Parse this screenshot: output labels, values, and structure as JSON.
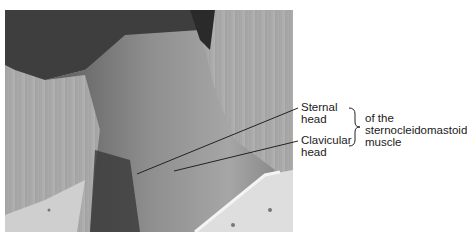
{
  "figure": {
    "labels": {
      "sternal_line1": "Sternal",
      "sternal_line2": "head",
      "clavicular_line1": "Clavicular",
      "clavicular_line2": "head",
      "muscle_line1": "of the",
      "muscle_line2": "sternocleidomastoid",
      "muscle_line3": "muscle"
    },
    "colors": {
      "background": "#ffffff",
      "skin_dark": "#4a4a4a",
      "skin_light": "#b8b8b8",
      "backdrop": "#a8a8a8",
      "gown": "#dcdcdc",
      "leader_line": "#222222"
    }
  }
}
